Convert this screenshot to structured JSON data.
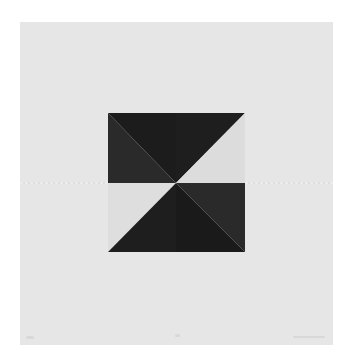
{
  "artwork": {
    "description": "Geometric print: square divided into two halves with diagonal triangles in black and light gray",
    "colors": {
      "background": "#ffffff",
      "paper": "#e6e6e6",
      "dark_a": "#1c1c1c",
      "dark_b": "#2a2a2a",
      "light": "#dcdcdc"
    }
  }
}
